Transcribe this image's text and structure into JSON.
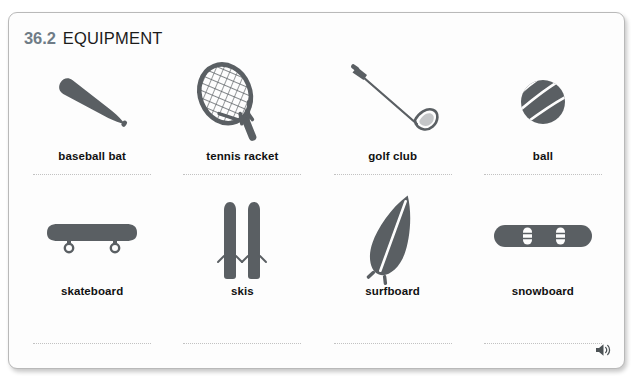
{
  "card": {
    "header": {
      "section_number": "36.2",
      "title": "EQUIPMENT"
    },
    "audio_icon": "speaker-icon",
    "colors": {
      "icon_gray": "#5a5f63",
      "section_number": "#6f7c87",
      "title": "#1b1b1b",
      "caption": "#111111",
      "divider": "#c2c2c2",
      "card_border": "#b9b9b9",
      "card_background": "#fdfdfd"
    },
    "rows": [
      {
        "items": [
          {
            "label": "baseball bat",
            "icon": "baseball-bat-icon"
          },
          {
            "label": "tennis racket",
            "icon": "tennis-racket-icon"
          },
          {
            "label": "golf club",
            "icon": "golf-club-icon"
          },
          {
            "label": "ball",
            "icon": "ball-icon"
          }
        ]
      },
      {
        "items": [
          {
            "label": "skateboard",
            "icon": "skateboard-icon"
          },
          {
            "label": "skis",
            "icon": "skis-icon"
          },
          {
            "label": "surfboard",
            "icon": "surfboard-icon"
          },
          {
            "label": "snowboard",
            "icon": "snowboard-icon"
          }
        ]
      }
    ]
  }
}
